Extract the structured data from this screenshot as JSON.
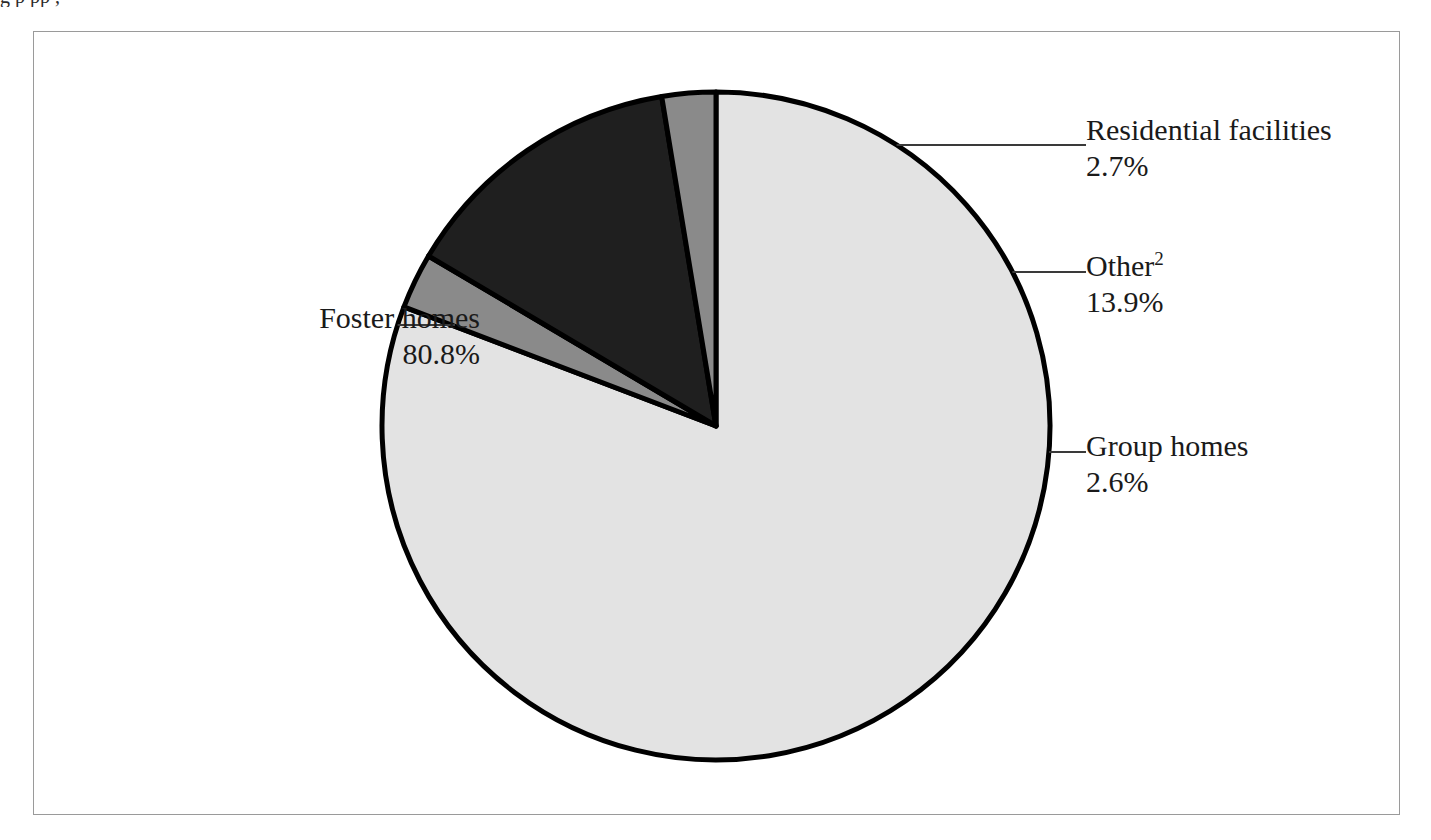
{
  "figure": {
    "frame_visible": true,
    "caption_sliver": "g                                                  p                    pp                                        ,"
  },
  "chart_data": {
    "type": "pie",
    "title": "",
    "subtitle": "",
    "xlabel": "",
    "ylabel": "",
    "legend_position": "callout-labels",
    "grid": false,
    "start_angle_deg": 0,
    "direction": "clockwise",
    "categories": [
      "Foster homes",
      "Residential facilities",
      "Other",
      "Group homes"
    ],
    "values": [
      80.8,
      2.7,
      13.9,
      2.6
    ],
    "units": "percent",
    "slices": [
      {
        "label": "Foster homes",
        "value": 80.8,
        "value_text": "80.8%",
        "color": "#e3e3e3",
        "footnote_marker": "",
        "callout_side": "left"
      },
      {
        "label": "Residential facilities",
        "value": 2.7,
        "value_text": "2.7%",
        "color": "#8a8a8a",
        "footnote_marker": "",
        "callout_side": "right"
      },
      {
        "label": "Other",
        "value": 13.9,
        "value_text": "13.9%",
        "color": "#1f1f1f",
        "footnote_marker": "2",
        "callout_side": "right"
      },
      {
        "label": "Group homes",
        "value": 2.6,
        "value_text": "2.6%",
        "color": "#8a8a8a",
        "footnote_marker": "",
        "callout_side": "right"
      }
    ]
  },
  "callouts": {
    "foster": {
      "label": "Foster homes",
      "value": "80.8%"
    },
    "residential": {
      "label": "Residential facilities",
      "value": "2.7%"
    },
    "other": {
      "label": "Other",
      "marker": "2",
      "value": "13.9%"
    },
    "group": {
      "label": "Group homes",
      "value": "2.6%"
    }
  },
  "colors": {
    "slice_light": "#e3e3e3",
    "slice_medium": "#8a8a8a",
    "slice_dark": "#1f1f1f",
    "outline": "#000000",
    "frame": "#9a9a9a",
    "text": "#1a1a1a",
    "page": "#ffffff"
  },
  "geometry": {
    "center_x": 716,
    "center_y": 426,
    "radius": 334
  }
}
